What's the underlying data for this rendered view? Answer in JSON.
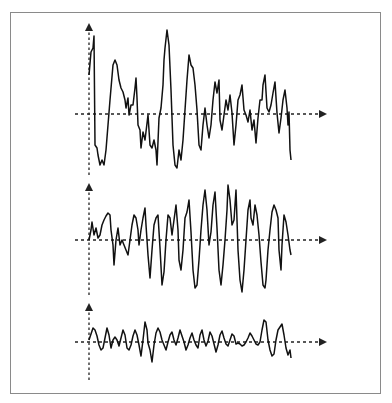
{
  "figure": {
    "panels": [
      {
        "name": "top",
        "y_axis": {
          "x": 89,
          "top": 25,
          "bottom": 175
        },
        "x_axis": {
          "y": 114,
          "left": 75,
          "right": 325
        },
        "points": "89,75 91,52 93,48 94,36 95,145 97,148 98,155 100,165 102,160 104,165 106,150 110,100 113,65 115,60 117,65 119,80 121,88 123,92 125,100 126,108 128,98 129,115 131,105 133,105 135,88 136,78 137,98 138,125 140,130 141,148 143,132 145,140 148,115 150,145 152,148 154,140 156,150 157,165 159,118 161,108 163,85 164,60 165,48 167,30 169,45 171,90 173,145 175,165 177,168 179,150 181,160 183,140 185,110 187,80 189,55 191,65 193,68 195,85 197,110 199,145 201,150 203,125 205,108 207,125 209,138 211,125 213,100 215,82 217,93 219,80 220,120 222,130 224,115 226,100 228,110 230,95 232,113 234,145 236,125 238,100 240,95 242,85 244,110 246,115 248,122 250,110 252,130 254,120 256,143 258,118 260,100 262,100 263,85 265,75 267,108 269,112 271,105 273,93 275,82 277,113 279,133 281,118 283,100 285,90 287,108 288,125 289,112 290,150 291,160"
      },
      {
        "name": "middle",
        "y_axis": {
          "x": 89,
          "top": 185,
          "bottom": 295
        },
        "x_axis": {
          "y": 240,
          "left": 75,
          "right": 325
        },
        "points": "89,240 91,230 92,222 94,235 96,228 98,238 100,235 102,225 104,220 106,216 108,213 110,215 111,230 113,245 114,265 116,240 118,228 120,245 122,240 124,245 126,250 128,255 130,240 132,225 134,215 136,218 138,230 139,245 141,230 143,218 145,208 146,225 148,255 150,278 152,250 154,225 156,218 158,215 160,248 162,285 164,272 166,240 168,215 170,218 172,235 174,220 176,205 178,230 179,260 181,270 183,250 185,218 187,212 189,200 191,232 193,270 195,288 197,285 199,260 201,230 203,205 205,190 207,210 209,245 211,232 213,205 215,192 217,228 219,270 221,285 223,265 225,240 227,210 228,185 230,200 232,225 234,220 236,190 238,250 240,280 242,292 244,270 246,240 248,210 250,200 251,218 253,225 255,205 257,215 259,235 261,262 263,285 265,288 266,280 268,250 270,230 272,212 274,205 276,210 278,218 279,250 281,270 282,245 284,215 286,222 288,235 290,250 291,255"
      },
      {
        "name": "bottom",
        "y_axis": {
          "x": 89,
          "top": 305,
          "bottom": 380
        },
        "x_axis": {
          "y": 342,
          "left": 75,
          "right": 325
        },
        "points": "89,340 91,334 93,328 95,330 97,336 99,345 101,350 103,348 105,338 107,328 109,335 111,348 113,340 115,337 117,340 119,346 121,338 123,330 125,335 127,348 129,350 131,345 133,336 135,330 137,335 139,345 141,356 143,340 145,322 147,330 148,343 150,350 152,362 154,345 156,333 158,328 160,332 162,340 164,345 166,350 168,342 170,335 172,332 174,340 176,345 178,338 180,330 182,336 184,342 186,350 188,345 190,338 192,333 194,340 196,345 198,348 200,335 202,330 204,340 206,346 208,341 210,332 212,336 214,344 216,352 218,345 220,335 222,331 224,338 226,344 228,346 230,340 232,334 234,336 236,344 238,343 240,344 242,346 244,345 246,342 248,338 250,333 252,336 254,340 256,344 258,345 260,342 262,330 264,320 266,322 268,340 270,350 272,356 274,354 276,340 278,330 280,327 282,324 284,335 286,348 288,355 290,350 291,358"
      }
    ]
  },
  "style": {
    "line_color": "#111111",
    "axis_color": "#222222",
    "frame_color": "#8a8a8a"
  }
}
